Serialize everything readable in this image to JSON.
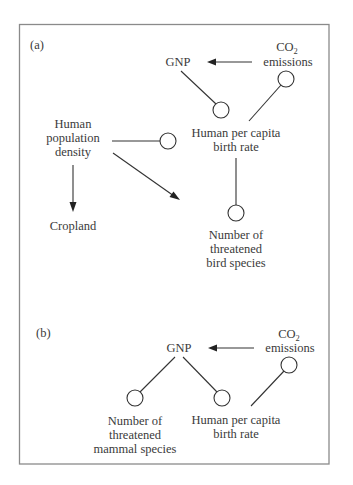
{
  "figure": {
    "panel_a": {
      "label": "(a)",
      "nodes": {
        "gnp": "GNP",
        "co2": {
          "main": "CO",
          "sub": "2",
          "line2": "emissions"
        },
        "birth_rate": {
          "line1": "Human per capita",
          "line2": "birth rate"
        },
        "population_density": {
          "line1": "Human",
          "line2": "population",
          "line3": "density"
        },
        "cropland": "Cropland",
        "bird_species": {
          "line1": "Number of",
          "line2": "threatened",
          "line3": "bird species"
        }
      },
      "edges": [
        {
          "from": "CO2 emissions",
          "to": "GNP",
          "type": "positive"
        },
        {
          "from": "GNP",
          "to": "Human per capita birth rate",
          "type": "negative"
        },
        {
          "from": "Human per capita birth rate",
          "to": "CO2 emissions",
          "type": "negative"
        },
        {
          "from": "Human population density",
          "to": "Human per capita birth rate",
          "type": "negative"
        },
        {
          "from": "Human population density",
          "to": "Cropland",
          "type": "positive"
        },
        {
          "from": "Human population density",
          "to": "Number of threatened bird species",
          "type": "positive"
        },
        {
          "from": "Human per capita birth rate",
          "to": "Number of threatened bird species",
          "type": "negative"
        }
      ]
    },
    "panel_b": {
      "label": "(b)",
      "nodes": {
        "gnp": "GNP",
        "co2": {
          "main": "CO",
          "sub": "2",
          "line2": "emissions"
        },
        "mammal_species": {
          "line1": "Number of",
          "line2": "threatened",
          "line3": "mammal species"
        },
        "birth_rate": {
          "line1": "Human per capita",
          "line2": "birth rate"
        }
      },
      "edges": [
        {
          "from": "CO2 emissions",
          "to": "GNP",
          "type": "positive"
        },
        {
          "from": "GNP",
          "to": "Number of threatened mammal species",
          "type": "negative"
        },
        {
          "from": "GNP",
          "to": "Human per capita birth rate",
          "type": "negative"
        },
        {
          "from": "Human per capita birth rate",
          "to": "CO2 emissions",
          "type": "negative"
        }
      ]
    },
    "legend_semantics": {
      "arrow": "positive effect",
      "circle_end": "negative effect"
    },
    "colors": {
      "line": "#333333",
      "text": "#3a3a3a",
      "frame": "#8a8a8a",
      "background": "#ffffff"
    }
  }
}
